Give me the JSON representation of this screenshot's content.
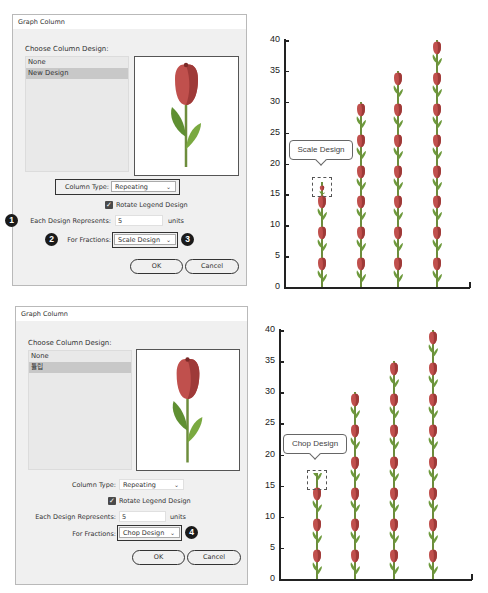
{
  "dialogs": [
    {
      "title": "Graph Column",
      "choose_label": "Choose Column Design:",
      "designs": [
        {
          "label": "None",
          "selected": false
        },
        {
          "label": "New Design",
          "selected": true
        }
      ],
      "preview_icon": "tulip",
      "column_type_label": "Column Type:",
      "column_type_value": "Repeating",
      "rotate_legend_label": "Rotate Legend Design",
      "rotate_legend_checked": true,
      "each_design_label": "Each Design Represents:",
      "each_design_value": "5",
      "units_label": "units",
      "fractions_label": "For Fractions:",
      "fractions_value": "Scale Design",
      "ok_label": "OK",
      "cancel_label": "Cancel",
      "badges": [
        "1",
        "2",
        "3"
      ]
    },
    {
      "title": "Graph Column",
      "choose_label": "Choose Column Design:",
      "designs": [
        {
          "label": "None",
          "selected": false
        },
        {
          "label": "튤립",
          "selected": true
        }
      ],
      "preview_icon": "tulip",
      "column_type_label": "Column Type:",
      "column_type_value": "Repeating",
      "rotate_legend_label": "Rotate Legend Design",
      "rotate_legend_checked": true,
      "each_design_label": "Each Design Represents:",
      "each_design_value": "5",
      "units_label": "units",
      "fractions_label": "For Fractions:",
      "fractions_value": "Chop Design",
      "ok_label": "OK",
      "cancel_label": "Cancel",
      "badges": [
        "4"
      ]
    }
  ],
  "colors": {
    "tulip_petal": "#c0504d",
    "tulip_petal_dark": "#9e3a38",
    "tulip_leaf": "#6d9a3c",
    "tulip_stem": "#6d8d3c",
    "dialog_bg": "#f0f0f0",
    "selected_bg": "#c8c8c8"
  },
  "chart_data": [
    {
      "type": "bar",
      "title": "",
      "annotation": "Scale Design",
      "fraction_mode": "scale",
      "unit_value": 5,
      "categories": [
        "1",
        "2",
        "3",
        "4"
      ],
      "values": [
        17,
        30,
        35,
        40
      ],
      "yticks": [
        0,
        5,
        10,
        15,
        20,
        25,
        30,
        35,
        40
      ],
      "ylim": [
        0,
        40
      ],
      "xlabel": "",
      "ylabel": "",
      "grid": false,
      "legend": "none"
    },
    {
      "type": "bar",
      "title": "",
      "annotation": "Chop Design",
      "fraction_mode": "chop",
      "unit_value": 5,
      "categories": [
        "1",
        "2",
        "3",
        "4"
      ],
      "values": [
        17,
        30,
        35,
        40
      ],
      "yticks": [
        0,
        5,
        10,
        15,
        20,
        25,
        30,
        35,
        40
      ],
      "ylim": [
        0,
        40
      ],
      "xlabel": "",
      "ylabel": "",
      "grid": false,
      "legend": "none"
    }
  ]
}
